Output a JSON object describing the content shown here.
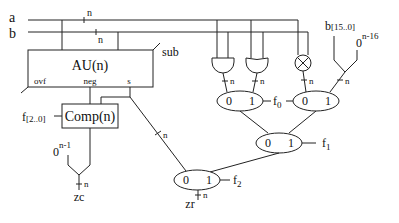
{
  "diagram": {
    "inputs": {
      "a": "a",
      "b": "b",
      "a_width": "n",
      "b_width": "n"
    },
    "au": {
      "label": "AU(n)",
      "ctrl": "sub",
      "ports": {
        "ovf": "ovf",
        "neg": "neg",
        "s": "s"
      }
    },
    "comp": {
      "label": "Comp(n)",
      "ctrl": "f",
      "ctrl_sub": "[2..0]"
    },
    "s_width": "n",
    "zc": {
      "const_base": "0",
      "const_exp": "n-1",
      "width": "n",
      "label": "zc"
    },
    "gates": {
      "and_width": "n",
      "or_width": "n",
      "xor_width": "n",
      "lui_width": "n"
    },
    "lui": {
      "src": "b",
      "src_range": "[15..0]",
      "const_base": "0",
      "const_exp": "n-16"
    },
    "muxes": {
      "mux_a": {
        "in0": "0",
        "in1": "1"
      },
      "mux_b": {
        "in0": "0",
        "in1": "1"
      },
      "mux_c": {
        "in0": "0",
        "in1": "1"
      },
      "mux_d": {
        "in0": "0",
        "in1": "1"
      }
    },
    "selects": {
      "f0": "f",
      "f0_sub": "0",
      "f1": "f",
      "f1_sub": "1",
      "f2": "f",
      "f2_sub": "2"
    },
    "zr": {
      "label": "zr",
      "width": "n"
    }
  }
}
